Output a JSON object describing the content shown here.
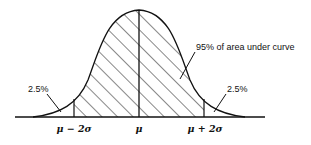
{
  "diagram": {
    "type": "normal-distribution-curve",
    "annotations": {
      "center_area": "95% of area under curve",
      "left_tail": "2.5%",
      "right_tail": "2.5%"
    },
    "axis_labels": {
      "left": "μ − 2σ",
      "center": "μ",
      "right": "μ + 2σ"
    },
    "colors": {
      "stroke": "#111111",
      "background": "#ffffff"
    }
  }
}
